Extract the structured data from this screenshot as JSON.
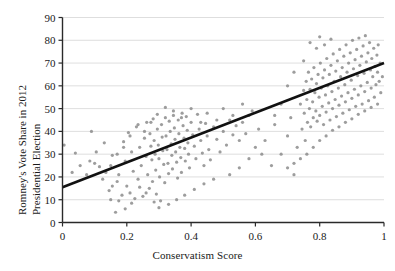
{
  "chart_data": {
    "type": "scatter",
    "title": "",
    "xlabel": "Conservatism Score",
    "ylabel": "Romney's Vote Share in 2012 Presidential Election",
    "ylabel_lines": [
      "Romney's Vote Share in 2012",
      "Presidential Election"
    ],
    "xlim": [
      0,
      1
    ],
    "ylim": [
      0,
      90
    ],
    "xticks": [
      "0",
      "0.2",
      "0.4",
      "0.6",
      "0.8",
      "1"
    ],
    "xtick_values": [
      0,
      0.2,
      0.4,
      0.6,
      0.8,
      1
    ],
    "yticks": [
      "0",
      "10",
      "20",
      "30",
      "40",
      "50",
      "60",
      "70",
      "80",
      "90"
    ],
    "ytick_values": [
      0,
      10,
      20,
      30,
      40,
      50,
      60,
      70,
      80,
      90
    ],
    "grid": "horizontal",
    "grid_color": "#d6d6d6",
    "axis_color": "#2a2a2a",
    "legend": "none",
    "point_color": "#8c8c8c",
    "point_size": 1.6,
    "trend_line": {
      "type": "linear-fit",
      "color": "#111111",
      "width": 2.6,
      "x_start": 0,
      "y_start": 15.5,
      "x_end": 1,
      "y_end": 70
    },
    "points": [
      [
        0.005,
        34.0
      ],
      [
        0.04,
        30.5
      ],
      [
        0.09,
        40.0
      ],
      [
        0.1,
        26.0
      ],
      [
        0.115,
        24.5
      ],
      [
        0.145,
        14.0
      ],
      [
        0.15,
        10.0
      ],
      [
        0.155,
        29.5
      ],
      [
        0.165,
        4.5
      ],
      [
        0.17,
        18.0
      ],
      [
        0.175,
        21.0
      ],
      [
        0.185,
        12.0
      ],
      [
        0.19,
        35.5
      ],
      [
        0.195,
        27.0
      ],
      [
        0.2,
        16.0
      ],
      [
        0.205,
        39.5
      ],
      [
        0.21,
        13.0
      ],
      [
        0.215,
        31.0
      ],
      [
        0.22,
        22.5
      ],
      [
        0.225,
        10.5
      ],
      [
        0.23,
        42.0
      ],
      [
        0.235,
        19.0
      ],
      [
        0.24,
        33.0
      ],
      [
        0.245,
        25.0
      ],
      [
        0.25,
        11.5
      ],
      [
        0.255,
        37.0
      ],
      [
        0.26,
        29.0
      ],
      [
        0.262,
        44.0
      ],
      [
        0.265,
        21.0
      ],
      [
        0.27,
        15.0
      ],
      [
        0.272,
        39.0
      ],
      [
        0.275,
        33.5
      ],
      [
        0.278,
        27.5
      ],
      [
        0.28,
        18.0
      ],
      [
        0.282,
        45.5
      ],
      [
        0.285,
        36.0
      ],
      [
        0.288,
        30.0
      ],
      [
        0.29,
        23.0
      ],
      [
        0.292,
        12.5
      ],
      [
        0.295,
        41.0
      ],
      [
        0.298,
        34.0
      ],
      [
        0.3,
        28.0
      ],
      [
        0.302,
        20.0
      ],
      [
        0.305,
        9.5
      ],
      [
        0.308,
        43.0
      ],
      [
        0.31,
        37.5
      ],
      [
        0.312,
        31.5
      ],
      [
        0.315,
        25.5
      ],
      [
        0.318,
        17.5
      ],
      [
        0.32,
        46.0
      ],
      [
        0.322,
        38.0
      ],
      [
        0.325,
        32.0
      ],
      [
        0.328,
        26.0
      ],
      [
        0.33,
        21.5
      ],
      [
        0.332,
        44.5
      ],
      [
        0.335,
        40.0
      ],
      [
        0.338,
        34.5
      ],
      [
        0.34,
        29.5
      ],
      [
        0.342,
        23.5
      ],
      [
        0.345,
        47.0
      ],
      [
        0.348,
        41.5
      ],
      [
        0.35,
        36.5
      ],
      [
        0.352,
        31.0
      ],
      [
        0.355,
        26.5
      ],
      [
        0.358,
        19.5
      ],
      [
        0.36,
        45.0
      ],
      [
        0.362,
        39.0
      ],
      [
        0.365,
        33.0
      ],
      [
        0.368,
        28.5
      ],
      [
        0.37,
        22.0
      ],
      [
        0.372,
        48.0
      ],
      [
        0.375,
        42.5
      ],
      [
        0.378,
        37.0
      ],
      [
        0.38,
        32.5
      ],
      [
        0.382,
        27.0
      ],
      [
        0.385,
        46.5
      ],
      [
        0.388,
        40.5
      ],
      [
        0.39,
        35.0
      ],
      [
        0.392,
        30.0
      ],
      [
        0.395,
        24.0
      ],
      [
        0.4,
        44.0
      ],
      [
        0.405,
        38.5
      ],
      [
        0.41,
        33.5
      ],
      [
        0.415,
        28.0
      ],
      [
        0.42,
        47.5
      ],
      [
        0.425,
        41.0
      ],
      [
        0.43,
        36.0
      ],
      [
        0.435,
        30.5
      ],
      [
        0.44,
        25.0
      ],
      [
        0.445,
        43.5
      ],
      [
        0.45,
        38.0
      ],
      [
        0.455,
        32.0
      ],
      [
        0.46,
        27.5
      ],
      [
        0.47,
        42.0
      ],
      [
        0.48,
        36.5
      ],
      [
        0.49,
        31.0
      ],
      [
        0.5,
        40.0
      ],
      [
        0.51,
        34.0
      ],
      [
        0.52,
        45.0
      ],
      [
        0.53,
        38.5
      ],
      [
        0.54,
        42.5
      ],
      [
        0.55,
        36.0
      ],
      [
        0.56,
        44.0
      ],
      [
        0.57,
        39.0
      ],
      [
        0.58,
        47.0
      ],
      [
        0.6,
        33.0
      ],
      [
        0.61,
        41.0
      ],
      [
        0.63,
        36.0
      ],
      [
        0.65,
        25.0
      ],
      [
        0.66,
        43.0
      ],
      [
        0.68,
        30.0
      ],
      [
        0.7,
        38.0
      ],
      [
        0.71,
        46.0
      ],
      [
        0.72,
        21.0
      ],
      [
        0.73,
        33.0
      ],
      [
        0.74,
        52.0
      ],
      [
        0.745,
        41.0
      ],
      [
        0.75,
        58.0
      ],
      [
        0.752,
        48.0
      ],
      [
        0.755,
        36.0
      ],
      [
        0.758,
        62.0
      ],
      [
        0.76,
        54.0
      ],
      [
        0.762,
        44.0
      ],
      [
        0.765,
        66.0
      ],
      [
        0.768,
        50.0
      ],
      [
        0.77,
        58.5
      ],
      [
        0.772,
        42.0
      ],
      [
        0.775,
        63.0
      ],
      [
        0.778,
        53.0
      ],
      [
        0.78,
        46.0
      ],
      [
        0.782,
        68.0
      ],
      [
        0.785,
        57.0
      ],
      [
        0.788,
        49.0
      ],
      [
        0.79,
        61.0
      ],
      [
        0.792,
        44.5
      ],
      [
        0.795,
        65.0
      ],
      [
        0.798,
        55.0
      ],
      [
        0.8,
        47.0
      ],
      [
        0.802,
        70.0
      ],
      [
        0.805,
        59.0
      ],
      [
        0.808,
        51.0
      ],
      [
        0.81,
        63.5
      ],
      [
        0.812,
        43.0
      ],
      [
        0.815,
        67.0
      ],
      [
        0.818,
        56.0
      ],
      [
        0.82,
        48.5
      ],
      [
        0.822,
        72.0
      ],
      [
        0.825,
        60.0
      ],
      [
        0.828,
        52.5
      ],
      [
        0.83,
        65.0
      ],
      [
        0.832,
        45.0
      ],
      [
        0.835,
        69.0
      ],
      [
        0.838,
        57.5
      ],
      [
        0.84,
        50.0
      ],
      [
        0.842,
        74.0
      ],
      [
        0.845,
        62.0
      ],
      [
        0.848,
        54.0
      ],
      [
        0.85,
        66.5
      ],
      [
        0.852,
        46.5
      ],
      [
        0.855,
        71.0
      ],
      [
        0.858,
        59.0
      ],
      [
        0.86,
        51.5
      ],
      [
        0.862,
        76.0
      ],
      [
        0.865,
        64.0
      ],
      [
        0.868,
        55.5
      ],
      [
        0.87,
        68.0
      ],
      [
        0.872,
        48.0
      ],
      [
        0.875,
        73.0
      ],
      [
        0.878,
        60.5
      ],
      [
        0.88,
        53.0
      ],
      [
        0.882,
        78.0
      ],
      [
        0.885,
        66.0
      ],
      [
        0.888,
        57.0
      ],
      [
        0.89,
        70.0
      ],
      [
        0.892,
        49.5
      ],
      [
        0.895,
        74.5
      ],
      [
        0.898,
        62.5
      ],
      [
        0.9,
        54.5
      ],
      [
        0.902,
        80.0
      ],
      [
        0.905,
        67.5
      ],
      [
        0.908,
        58.5
      ],
      [
        0.91,
        71.5
      ],
      [
        0.912,
        51.0
      ],
      [
        0.915,
        76.0
      ],
      [
        0.918,
        64.5
      ],
      [
        0.92,
        56.0
      ],
      [
        0.922,
        81.0
      ],
      [
        0.925,
        69.0
      ],
      [
        0.928,
        60.0
      ],
      [
        0.93,
        73.0
      ],
      [
        0.932,
        52.0
      ],
      [
        0.935,
        77.5
      ],
      [
        0.938,
        65.5
      ],
      [
        0.94,
        57.5
      ],
      [
        0.942,
        82.0
      ],
      [
        0.945,
        70.5
      ],
      [
        0.948,
        61.5
      ],
      [
        0.95,
        74.5
      ],
      [
        0.952,
        53.5
      ],
      [
        0.955,
        79.0
      ],
      [
        0.958,
        67.0
      ],
      [
        0.96,
        59.0
      ],
      [
        0.962,
        72.0
      ],
      [
        0.965,
        64.0
      ],
      [
        0.968,
        76.5
      ],
      [
        0.97,
        55.0
      ],
      [
        0.972,
        68.5
      ],
      [
        0.975,
        60.5
      ],
      [
        0.978,
        73.5
      ],
      [
        0.98,
        66.0
      ],
      [
        0.982,
        78.0
      ],
      [
        0.985,
        62.0
      ],
      [
        0.988,
        70.0
      ],
      [
        0.99,
        57.0
      ],
      [
        0.995,
        64.0
      ],
      [
        0.77,
        79.0
      ],
      [
        0.79,
        76.5
      ],
      [
        0.8,
        81.5
      ],
      [
        0.815,
        78.0
      ],
      [
        0.835,
        80.5
      ],
      [
        0.72,
        66.0
      ],
      [
        0.7,
        60.0
      ],
      [
        0.68,
        52.0
      ],
      [
        0.66,
        47.0
      ],
      [
        0.75,
        71.0
      ],
      [
        0.76,
        30.0
      ],
      [
        0.78,
        33.0
      ],
      [
        0.8,
        36.0
      ],
      [
        0.82,
        38.0
      ],
      [
        0.84,
        40.5
      ],
      [
        0.86,
        42.0
      ],
      [
        0.88,
        44.0
      ],
      [
        0.9,
        45.5
      ],
      [
        0.92,
        47.5
      ],
      [
        0.94,
        49.0
      ],
      [
        0.96,
        50.5
      ],
      [
        0.98,
        52.0
      ],
      [
        0.74,
        28.0
      ],
      [
        0.72,
        26.0
      ],
      [
        0.7,
        24.0
      ],
      [
        0.62,
        30.0
      ],
      [
        0.58,
        28.0
      ],
      [
        0.55,
        24.0
      ],
      [
        0.52,
        21.0
      ],
      [
        0.47,
        19.0
      ],
      [
        0.44,
        17.0
      ],
      [
        0.41,
        14.5
      ],
      [
        0.38,
        12.0
      ],
      [
        0.355,
        10.0
      ],
      [
        0.33,
        8.0
      ],
      [
        0.3,
        6.5
      ],
      [
        0.285,
        9.0
      ],
      [
        0.26,
        13.0
      ],
      [
        0.24,
        15.5
      ],
      [
        0.215,
        8.5
      ],
      [
        0.195,
        6.0
      ],
      [
        0.175,
        9.5
      ],
      [
        0.155,
        16.0
      ],
      [
        0.135,
        22.0
      ],
      [
        0.125,
        19.0
      ],
      [
        0.105,
        31.0
      ],
      [
        0.085,
        27.0
      ],
      [
        0.075,
        21.0
      ],
      [
        0.055,
        25.0
      ],
      [
        0.03,
        22.0
      ],
      [
        0.45,
        48.0
      ],
      [
        0.48,
        45.0
      ],
      [
        0.5,
        50.0
      ],
      [
        0.53,
        47.0
      ],
      [
        0.56,
        52.0
      ],
      [
        0.59,
        49.0
      ],
      [
        0.43,
        44.0
      ],
      [
        0.4,
        50.0
      ],
      [
        0.37,
        46.0
      ],
      [
        0.345,
        49.0
      ],
      [
        0.32,
        50.5
      ],
      [
        0.295,
        47.5
      ],
      [
        0.275,
        44.0
      ],
      [
        0.255,
        40.0
      ],
      [
        0.235,
        43.0
      ],
      [
        0.21,
        38.0
      ],
      [
        0.19,
        33.0
      ],
      [
        0.17,
        30.0
      ],
      [
        0.15,
        25.0
      ],
      [
        0.13,
        35.0
      ]
    ]
  }
}
